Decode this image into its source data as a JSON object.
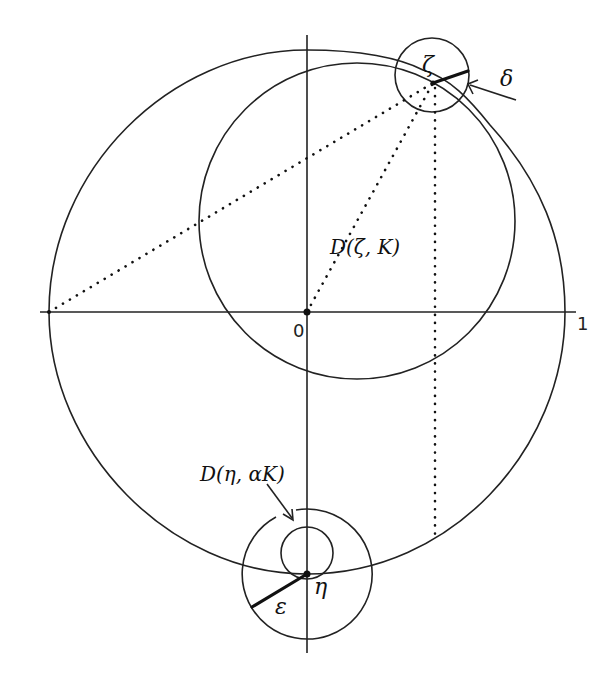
{
  "figure": {
    "labels": {
      "origin": "0",
      "unit": "1",
      "zeta": "ζ",
      "delta": "δ",
      "disk_zeta": "D(ζ, K)",
      "disk_eta": "D(η, αK)",
      "eta": "η",
      "epsilon": "ε"
    },
    "points": {
      "origin": {
        "name": "0",
        "x": 307,
        "y": 312
      },
      "zeta": {
        "name": "ζ",
        "x": 433,
        "y": 83
      },
      "eta": {
        "name": "η",
        "x": 307,
        "y": 574
      },
      "left_axis_point": {
        "x": 49,
        "y": 312
      },
      "unit_point": {
        "name": "1",
        "x": 565,
        "y": 312
      }
    },
    "circles": [
      {
        "name": "unit-circle-outer-curve",
        "cx": 307,
        "cy": 312,
        "r": 258
      },
      {
        "name": "disk-D-zeta-K",
        "cx": 357,
        "cy": 221,
        "r": 158
      },
      {
        "name": "delta-circle-around-zeta",
        "cx": 432,
        "cy": 75,
        "r": 37
      },
      {
        "name": "disk-D-eta-alphaK",
        "cx": 307,
        "cy": 553,
        "r": 26
      },
      {
        "name": "epsilon-circle-around-eta",
        "cx": 307,
        "cy": 574,
        "r": 65
      }
    ],
    "colors": {
      "ink": "#111111",
      "background": "#ffffff"
    }
  }
}
